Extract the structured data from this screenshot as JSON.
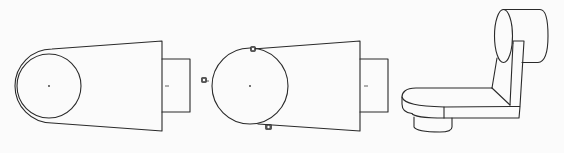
{
  "figure": {
    "description": "Three-stage CAD sketch-to-solid illustration of a bracket",
    "panels": [
      {
        "id": "sketch-with-offset",
        "label": "Profile sketch with offset arc and concentric hole",
        "circle_center": [
          49,
          86
        ],
        "inner_circle_radius": 33,
        "outer_arc_radius": 37,
        "body_right_x": 162,
        "body_top": [
          [
            50,
            49
          ],
          [
            162,
            41
          ]
        ],
        "body_bottom": [
          [
            50,
            123
          ],
          [
            162,
            131
          ]
        ],
        "boss_rect": {
          "x": 162,
          "y": 59,
          "w": 28,
          "h": 53
        }
      },
      {
        "id": "sketch-with-constraints",
        "label": "Profile sketch with tangent constraint glyphs",
        "circle_center": [
          250,
          86
        ],
        "circle_radius": 38,
        "body_right_x": 360,
        "body_top": [
          [
            253,
            49
          ],
          [
            360,
            41
          ]
        ],
        "body_bottom": [
          [
            258,
            124
          ],
          [
            360,
            131
          ]
        ],
        "boss_rect": {
          "x": 360,
          "y": 59,
          "w": 28,
          "h": 53
        },
        "constraint_glyphs": [
          {
            "name": "tangent-top",
            "pos": [
              253,
              49
            ]
          },
          {
            "name": "tangent-left",
            "pos": [
              204,
              80
            ]
          },
          {
            "name": "tangent-bottom",
            "pos": [
              268,
              127
            ]
          }
        ]
      },
      {
        "id": "solid-model",
        "label": "Resulting 3D L-shaped bracket with cylinder"
      }
    ],
    "colors": {
      "background": "#fbfbfb",
      "line": "#2a2a2a"
    }
  }
}
